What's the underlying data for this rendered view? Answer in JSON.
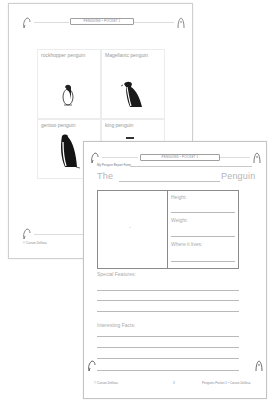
{
  "back_page": {
    "header_banner": "PENGUINS • POCKET 1",
    "cards": [
      {
        "label": "rockhopper penguin",
        "image": "rockhopper-penguin-illustration"
      },
      {
        "label": "Magellanic penguin",
        "image": "magellanic-penguin-illustration"
      },
      {
        "label": "gentoo penguin",
        "image": "gentoo-penguin-illustration"
      },
      {
        "label": "king penguin",
        "image": "king-penguin-illustration"
      }
    ],
    "footer_left": "© Carson-Dellosa"
  },
  "front_page": {
    "header_banner": "PENGUINS • POCKET 1",
    "form_title": "My Penguin Report Form:",
    "title_prefix": "The",
    "title_suffix": "Penguin",
    "image_placeholder": "~",
    "fields": [
      {
        "label": "Height:"
      },
      {
        "label": "Weight:"
      },
      {
        "label": "Where it lives:"
      }
    ],
    "special_features_label": "Special Features:",
    "interesting_facts_label": "Interesting Facts:",
    "footer_left": "© Carson-Dellosa",
    "footer_center": "3",
    "footer_right": "Penguins Pocket 1 • Carson-Dellosa"
  },
  "colors": {
    "page_border": "#cfcfcf",
    "rule": "#b9b9b9",
    "box_border": "#8a8a8a",
    "penguin": "#1a1a1a"
  }
}
